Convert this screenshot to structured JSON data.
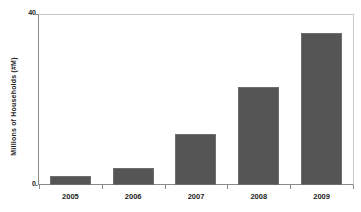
{
  "chart_data": {
    "type": "bar",
    "title": "",
    "subtitle": "",
    "xlabel": "",
    "ylabel": "Millions of Households (#M)",
    "categories": [
      "2005",
      "2006",
      "2007",
      "2008",
      "2009"
    ],
    "values": [
      2,
      4,
      12,
      23,
      35.5
    ],
    "series": [
      {
        "name": "Millions of Households",
        "values": [
          2,
          4,
          12,
          23,
          35.5
        ]
      }
    ],
    "ylim": [
      0,
      40
    ],
    "ytick_labels": [
      "0",
      "40"
    ],
    "ytick_values": [
      0,
      40
    ],
    "grid": false,
    "legend": false,
    "legend_position": "none",
    "bar_color": "#555555",
    "bar_border_color": "#6e6e6e",
    "axis_color": "#8a8a8a",
    "frame_color": "#c8c8c8",
    "text_color": "#222222",
    "background": "#ffffff"
  }
}
